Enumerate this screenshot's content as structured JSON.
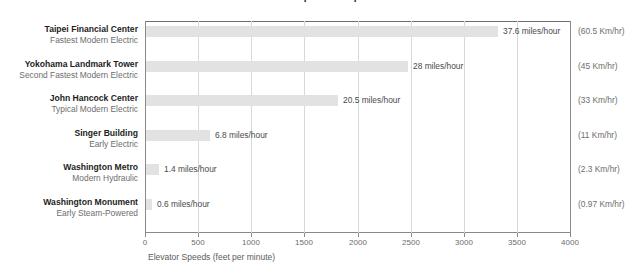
{
  "chart_data": {
    "type": "bar",
    "orientation": "horizontal",
    "title": "Elevator Speed Comparison",
    "xlabel": "Elevator Speeds (feet per minute)",
    "ylabel": "",
    "xlim": [
      0,
      4000
    ],
    "xticks": [
      0,
      500,
      1000,
      1500,
      2000,
      2500,
      3000,
      3500,
      4000
    ],
    "xtick_labels": [
      "0",
      "500",
      "1000",
      "1500",
      "2000",
      "2500",
      "3000",
      "3500",
      "4000"
    ],
    "grid": true,
    "legend": "none",
    "bar_color": "#e2e2e2",
    "categories": [
      "Taipei Financial Center",
      "Yokohama Landmark Tower",
      "John Hancock Center",
      "Singer Building",
      "Washington Metro",
      "Washington Monument"
    ],
    "values": [
      3309,
      2464,
      1804,
      598,
      123,
      53
    ],
    "rows": [
      {
        "name": "Taipei Financial Center",
        "descriptor": "Fastest Modern Electric",
        "feet_per_minute": 3309,
        "value_label": "37.6 miles/hour",
        "metric_label": "(60.5 Km/hr)"
      },
      {
        "name": "Yokohama Landmark Tower",
        "descriptor": "Second Fastest Modern Electric",
        "feet_per_minute": 2464,
        "value_label": "28 miles/hour",
        "metric_label": "(45 Km/hr)"
      },
      {
        "name": "John Hancock Center",
        "descriptor": "Typical Modern Electric",
        "feet_per_minute": 1804,
        "value_label": "20.5 miles/hour",
        "metric_label": "(33 Km/hr)"
      },
      {
        "name": "Singer Building",
        "descriptor": "Early Electric",
        "feet_per_minute": 598,
        "value_label": "6.8 miles/hour",
        "metric_label": "(11 Km/hr)"
      },
      {
        "name": "Washington Metro",
        "descriptor": "Modern Hydraulic",
        "feet_per_minute": 123,
        "value_label": "1.4 miles/hour",
        "metric_label": "(2.3 Km/hr)"
      },
      {
        "name": "Washington Monument",
        "descriptor": "Early Steam-Powered",
        "feet_per_minute": 53,
        "value_label": "0.6 miles/hour",
        "metric_label": "(0.97 Km/hr)"
      }
    ]
  }
}
